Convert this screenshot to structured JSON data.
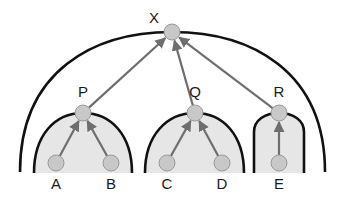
{
  "diagram": {
    "type": "tree",
    "nodes": [
      {
        "id": "X",
        "label": "X",
        "role": "root"
      },
      {
        "id": "P",
        "label": "P",
        "role": "internal"
      },
      {
        "id": "Q",
        "label": "Q",
        "role": "internal"
      },
      {
        "id": "R",
        "label": "R",
        "role": "internal"
      },
      {
        "id": "A",
        "label": "A",
        "role": "leaf"
      },
      {
        "id": "B",
        "label": "B",
        "role": "leaf"
      },
      {
        "id": "C",
        "label": "C",
        "role": "leaf"
      },
      {
        "id": "D",
        "label": "D",
        "role": "leaf"
      },
      {
        "id": "E",
        "label": "E",
        "role": "leaf"
      }
    ],
    "edges": [
      {
        "from": "A",
        "to": "P"
      },
      {
        "from": "B",
        "to": "P"
      },
      {
        "from": "C",
        "to": "Q"
      },
      {
        "from": "D",
        "to": "Q"
      },
      {
        "from": "E",
        "to": "R"
      },
      {
        "from": "P",
        "to": "X"
      },
      {
        "from": "Q",
        "to": "X"
      },
      {
        "from": "R",
        "to": "X"
      }
    ],
    "groups": [
      {
        "id": "dome-P",
        "contains": [
          "P",
          "A",
          "B"
        ]
      },
      {
        "id": "dome-Q",
        "contains": [
          "Q",
          "C",
          "D"
        ]
      },
      {
        "id": "dome-R",
        "contains": [
          "R",
          "E"
        ]
      },
      {
        "id": "arc-X",
        "contains": [
          "X",
          "P",
          "Q",
          "R",
          "A",
          "B",
          "C",
          "D",
          "E"
        ]
      }
    ],
    "colors": {
      "node_fill": "#c8c8c8",
      "edge": "#6e6e6e",
      "dome_fill": "#e6e6e6",
      "outline": "#111111"
    }
  }
}
